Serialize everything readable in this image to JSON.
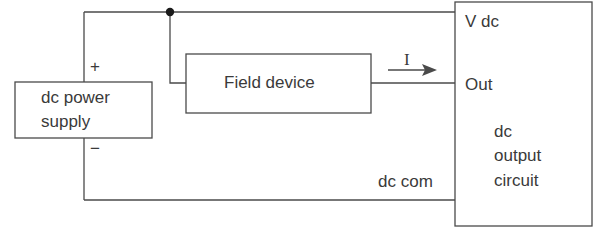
{
  "diagram": {
    "type": "circuit-wiring",
    "power_supply": {
      "label_line1": "dc power",
      "label_line2": "supply",
      "plus": "+",
      "minus": "−"
    },
    "field_device": {
      "label": "Field device"
    },
    "current": {
      "symbol": "I",
      "direction": "right"
    },
    "output_module": {
      "terminal_vdc": "V dc",
      "terminal_out": "Out",
      "title_line1": "dc",
      "title_line2": "output",
      "title_line3": "circuit"
    },
    "common_wire": {
      "label": "dc com"
    },
    "colors": {
      "line": "#4a4a4a",
      "text": "#3a3a3a",
      "junction": "#1a1a1a"
    }
  }
}
